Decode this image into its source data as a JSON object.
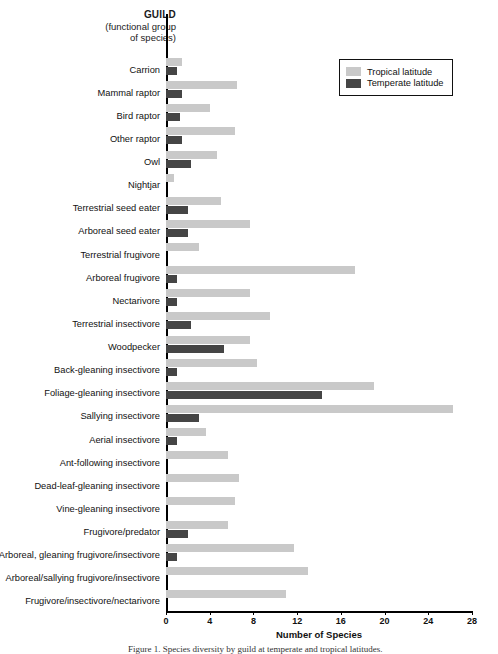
{
  "title": {
    "main": "GUILD",
    "sub_line1": "(functional group",
    "sub_line2": "of species)"
  },
  "legend": {
    "position": "top-right",
    "items": [
      {
        "label": "Tropical latitude",
        "color": "#c9c9c9"
      },
      {
        "label": "Temperate latitude",
        "color": "#454545"
      }
    ]
  },
  "axis": {
    "x_title": "Number of Species",
    "x_ticks": [
      "0",
      "4",
      "8",
      "12",
      "16",
      "20",
      "24",
      "28"
    ]
  },
  "caption": "Figure 1. Species diversity by guild at temperate and tropical latitudes.",
  "chart_data": {
    "type": "bar",
    "orientation": "horizontal",
    "title": "GUILD (functional group of species)",
    "xlabel": "Number of Species",
    "ylabel": "GUILD (functional group of species)",
    "xlim": [
      0,
      28
    ],
    "xticks": [
      0,
      4,
      8,
      12,
      16,
      20,
      24,
      28
    ],
    "grid": false,
    "legend_position": "top-right",
    "categories": [
      "Carrion",
      "Mammal raptor",
      "Bird raptor",
      "Other raptor",
      "Owl",
      "Nightjar",
      "Terrestrial seed eater",
      "Arboreal seed eater",
      "Terrestrial frugivore",
      "Arboreal frugivore",
      "Nectarivore",
      "Terrestrial insectivore",
      "Woodpecker",
      "Back-gleaning insectivore",
      "Foliage-gleaning insectivore",
      "Sallying insectivore",
      "Aerial insectivore",
      "Ant-following insectivore",
      "Dead-leaf-gleaning insectivore",
      "Vine-gleaning insectivore",
      "Frugivore/predator",
      "Arboreal, gleaning frugivore/insectivore",
      "Arboreal/sallying frugivore/insectivore",
      "Frugivore/insectivore/nectarivore"
    ],
    "series": [
      {
        "name": "Tropical latitude",
        "color": "#c9c9c9",
        "values": [
          1.5,
          6.5,
          4,
          6.3,
          4.7,
          0.7,
          5,
          7.7,
          3,
          17.3,
          7.7,
          9.5,
          7.7,
          8.3,
          19,
          26.3,
          3.7,
          5.7,
          6.7,
          6.3,
          5.7,
          11.7,
          13,
          11
        ]
      },
      {
        "name": "Temperate latitude",
        "color": "#454545",
        "values": [
          1,
          1.5,
          1.3,
          1.5,
          2.3,
          0,
          2,
          2,
          0,
          1,
          1,
          2.3,
          5.3,
          1,
          14.3,
          3,
          1,
          0,
          0,
          0,
          2,
          1,
          0,
          0
        ]
      }
    ]
  }
}
